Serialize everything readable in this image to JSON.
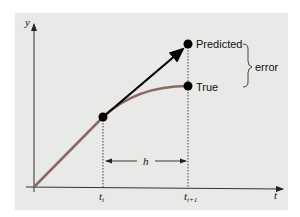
{
  "figure": {
    "background_color": "#e9e9e7",
    "axes": {
      "x_label": "t",
      "y_label": "y"
    },
    "ticks": [
      {
        "label": "t",
        "subscript": "i"
      },
      {
        "label": "t",
        "subscript": "i+1"
      }
    ],
    "step_label": "h",
    "points": {
      "start": {
        "label": ""
      },
      "predicted": {
        "label": "Predicted"
      },
      "true": {
        "label": "True"
      }
    },
    "brace_label": "error",
    "colors": {
      "true_curve": "#8a6a60",
      "predicted_line": "#000000",
      "axis": "#333333"
    }
  }
}
